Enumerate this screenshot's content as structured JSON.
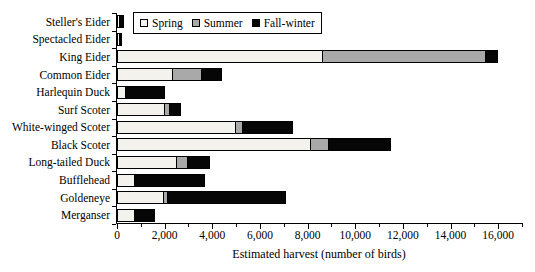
{
  "figure": {
    "xlabel": "Estimated harvest (number of birds)"
  },
  "legend": {
    "items": [
      {
        "name": "Spring",
        "label": "Spring",
        "color": "#f3f2ec"
      },
      {
        "name": "Summer",
        "label": "Summer",
        "color": "#a9a9a9"
      },
      {
        "name": "Fall-winter",
        "label": "Fall-winter",
        "color": "#060606"
      }
    ]
  },
  "chart_data": {
    "type": "bar",
    "orientation": "horizontal",
    "stacked": true,
    "title": "",
    "xlabel": "Estimated harvest (number of birds)",
    "ylabel": "",
    "xlim": [
      0,
      17000
    ],
    "x_major_ticks": [
      0,
      2000,
      4000,
      6000,
      8000,
      10000,
      12000,
      14000,
      16000
    ],
    "x_major_tick_labels": [
      "0",
      "2,000",
      "4,000",
      "6,000",
      "8,000",
      "10,000",
      "12,000",
      "14,000",
      "16,000"
    ],
    "x_minor_ticks": [
      1000,
      3000,
      5000,
      7000,
      9000,
      11000,
      13000,
      15000,
      17000
    ],
    "grid": false,
    "legend_position": "top",
    "categories": [
      "Steller's Eider",
      "Spectacled Eider",
      "King Eider",
      "Common Eider",
      "Harlequin Duck",
      "Surf Scoter",
      "White-winged Scoter",
      "Black Scoter",
      "Long-tailed Duck",
      "Bufflehead",
      "Goldeneye",
      "Merganser"
    ],
    "series": [
      {
        "name": "Spring",
        "color": "#f3f2ec",
        "values": [
          50,
          100,
          8600,
          2300,
          300,
          2000,
          4950,
          8100,
          2500,
          700,
          1900,
          700
        ]
      },
      {
        "name": "Summer",
        "color": "#a9a9a9",
        "values": [
          0,
          50,
          6900,
          1250,
          0,
          200,
          300,
          800,
          450,
          0,
          200,
          0
        ]
      },
      {
        "name": "Fall-winter",
        "color": "#060606",
        "values": [
          250,
          50,
          500,
          850,
          1700,
          500,
          2150,
          2600,
          950,
          3000,
          5000,
          900
        ]
      }
    ]
  }
}
